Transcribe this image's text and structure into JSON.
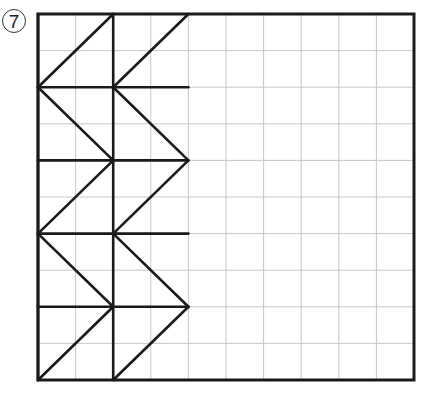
{
  "problem": {
    "number": "7"
  },
  "grid": {
    "columns": 10,
    "rows": 10,
    "origin_px": [
      38,
      14
    ],
    "size_px": [
      376,
      366
    ],
    "grid_line_color": "#c8c8c8",
    "figure_line_color": "#1a1a1a"
  },
  "figure": {
    "segments": [
      [
        0,
        0,
        0,
        10
      ],
      [
        2,
        0,
        2,
        10
      ],
      [
        0,
        2,
        4,
        2
      ],
      [
        0,
        4,
        4,
        4
      ],
      [
        0,
        6,
        4,
        6
      ],
      [
        0,
        8,
        4,
        8
      ],
      [
        0,
        2,
        2,
        0
      ],
      [
        2,
        2,
        4,
        0
      ],
      [
        0,
        2,
        2,
        4
      ],
      [
        2,
        2,
        4,
        4
      ],
      [
        0,
        6,
        2,
        4
      ],
      [
        2,
        6,
        4,
        4
      ],
      [
        0,
        6,
        2,
        8
      ],
      [
        2,
        6,
        4,
        8
      ],
      [
        0,
        10,
        2,
        8
      ],
      [
        2,
        10,
        4,
        8
      ]
    ]
  }
}
